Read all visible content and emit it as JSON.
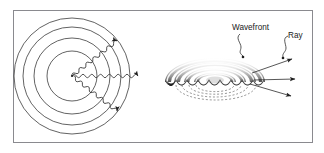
{
  "figure": {
    "background_color": "#ffffff",
    "frame": {
      "name": "figure-border",
      "x": 13,
      "y": 10,
      "width": 300,
      "height": 133,
      "stroke_color": "#8a8a8f",
      "fill_color": "#ffffff"
    },
    "labels": {
      "wavefront": "Wavefront",
      "ray": "Ray"
    },
    "panels": [
      {
        "id": "left-panel",
        "name": "two-dimensional-wavefront-panel",
        "description": "Top view: concentric circular wavefronts with sinusoidal rays",
        "source_point": {
          "x": 72,
          "y": 76
        },
        "circle_color": "#2a2a2a",
        "wave_color": "#2a2a2a",
        "circles": [
          {
            "index": 1,
            "radius": 25
          },
          {
            "index": 2,
            "radius": 38
          },
          {
            "index": 3,
            "radius": 49
          },
          {
            "index": 4,
            "radius": 58
          }
        ],
        "rays": [
          {
            "index": 1,
            "angle_deg": -38,
            "length": 62,
            "style": "sinusoidal",
            "arrow": true
          },
          {
            "index": 2,
            "angle_deg": 0,
            "length": 72,
            "style": "sinusoidal",
            "arrow": true
          },
          {
            "index": 3,
            "angle_deg": 38,
            "length": 62,
            "style": "sinusoidal",
            "arrow": true
          }
        ]
      },
      {
        "id": "right-panel",
        "name": "three-dimensional-wavefront-panel",
        "description": "Perspective view: shaded three-dimensional wave ridges with scalloped leading edges, dashed elliptical arcs beneath and three straight rays",
        "center": {
          "x": 215,
          "y": 82
        },
        "ridge_count": 4,
        "scallop_count": 9,
        "dashed_arc_count": 4,
        "ridge_highlight_color": "#f2f2f2",
        "ridge_shadow_color": "#2e2e2e",
        "ridge_mid_color": "#9a9a9a",
        "dashed_arc_color": "#4a4a4a",
        "rays": [
          {
            "index": 1,
            "from": {
              "x": 258,
              "y": 72
            },
            "to": {
              "x": 295,
              "y": 59
            },
            "arrow": true
          },
          {
            "index": 2,
            "from": {
              "x": 258,
              "y": 80
            },
            "to": {
              "x": 298,
              "y": 79
            },
            "arrow": true
          },
          {
            "index": 3,
            "from": {
              "x": 256,
              "y": 84
            },
            "to": {
              "x": 294,
              "y": 96
            },
            "arrow": true
          }
        ],
        "leaders": [
          {
            "for": "Wavefront",
            "text_anchor": {
              "x": 240,
              "y": 31
            },
            "dot": {
              "x": 243,
              "y": 57
            }
          },
          {
            "for": "Ray",
            "text_anchor": {
              "x": 289,
              "y": 39
            },
            "dot": {
              "x": 283,
              "y": 64
            }
          }
        ]
      }
    ]
  }
}
